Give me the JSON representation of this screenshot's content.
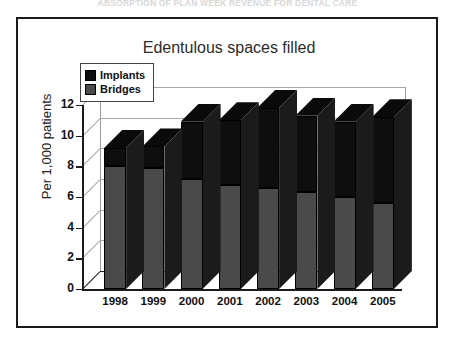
{
  "top_caption": "ABSORPTION OF PLAN WEEK REVENUE FOR DENTAL CARE",
  "frame": {
    "border_color": "#1a1a1a"
  },
  "chart_data": {
    "type": "bar",
    "subtype": "stacked-3d-column",
    "title": "Edentulous spaces filled",
    "xlabel": "",
    "ylabel": "Per 1,000 patients",
    "categories": [
      "1998",
      "1999",
      "2000",
      "2001",
      "2002",
      "2003",
      "2004",
      "2005"
    ],
    "series": [
      {
        "name": "Bridges",
        "color": "#4a4a4a",
        "values": [
          8.0,
          7.9,
          7.2,
          6.8,
          6.6,
          6.3,
          6.0,
          5.6
        ]
      },
      {
        "name": "Implants",
        "color": "#0e0e0e",
        "values": [
          1.2,
          1.4,
          3.7,
          4.2,
          5.2,
          5.0,
          4.9,
          5.6
        ]
      }
    ],
    "totals": [
      9.2,
      9.3,
      10.9,
      11.0,
      11.8,
      11.3,
      10.9,
      11.2
    ],
    "ylim": [
      0,
      12
    ],
    "yticks": [
      "0",
      "2",
      "4",
      "6",
      "8",
      "10",
      "12"
    ],
    "ytick_values": [
      0,
      2,
      4,
      6,
      8,
      10,
      12
    ],
    "grid": true,
    "legend_position": "top-left",
    "legend": [
      "Implants",
      "Bridges"
    ]
  }
}
